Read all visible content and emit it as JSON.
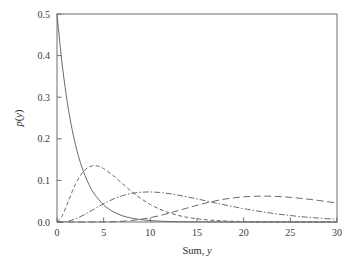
{
  "figure": {
    "background": "#ffffff",
    "frame_color": "#6f6f6f",
    "curve_color": "#6a6a6a"
  },
  "axes": {
    "x_label_prefix": "Sum,",
    "x_label_var": "y",
    "y_label_prefix": "p(",
    "y_label_var": "y",
    "y_label_suffix": ")",
    "x_ticks": [
      "0",
      "5",
      "10",
      "15",
      "20",
      "25",
      "30"
    ],
    "y_ticks": [
      "0.0",
      "0.1",
      "0.2",
      "0.3",
      "0.4",
      "0.5"
    ]
  },
  "chart_data": {
    "type": "line",
    "title": "",
    "xlabel": "Sum, y",
    "ylabel": "p(y)",
    "xlim": [
      0,
      30
    ],
    "ylim": [
      0.0,
      0.5
    ],
    "xticks": [
      0,
      5,
      10,
      15,
      20,
      25,
      30
    ],
    "yticks": [
      0.0,
      0.1,
      0.2,
      0.3,
      0.4,
      0.5
    ],
    "grid": false,
    "legend": "none",
    "series": [
      {
        "name": "n = 1",
        "linestyle": "solid",
        "rate": 0.5,
        "shape": 1,
        "peak_x": 0,
        "peak_y": 0.5,
        "x": [
          0,
          0.5,
          1,
          1.5,
          2,
          2.5,
          3,
          3.5,
          4,
          5,
          6,
          7,
          8,
          9,
          10,
          11,
          12,
          13,
          14,
          15,
          16,
          17,
          18,
          19,
          20,
          21,
          22,
          23,
          24,
          25,
          26,
          27,
          28,
          29,
          30
        ],
        "y": [
          0.5,
          0.3894,
          0.3033,
          0.2362,
          0.1839,
          0.1433,
          0.1116,
          0.0869,
          0.0677,
          0.041,
          0.0249,
          0.0151,
          0.0092,
          0.0056,
          0.0034,
          0.002,
          0.0012,
          0.0008,
          0.0005,
          0.0003,
          0.0002,
          0.0001,
          0.0001,
          0.0,
          0.0,
          0.0,
          0.0,
          0.0,
          0.0,
          0.0,
          0.0,
          0.0,
          0.0,
          0.0,
          0.0
        ]
      },
      {
        "name": "n = 3",
        "linestyle": "dashed",
        "rate": 0.5,
        "shape": 3,
        "peak_x": 4,
        "peak_y": 0.1353,
        "x": [
          0,
          0.5,
          1,
          1.5,
          2,
          2.5,
          3,
          3.5,
          4,
          4.5,
          5,
          6,
          7,
          8,
          9,
          10,
          11,
          12,
          13,
          14,
          15,
          16,
          17,
          18,
          19,
          20,
          22,
          24,
          26,
          28,
          30
        ],
        "y": [
          0,
          0.0122,
          0.0379,
          0.0664,
          0.092,
          0.1118,
          0.1255,
          0.133,
          0.1353,
          0.1335,
          0.1283,
          0.112,
          0.0925,
          0.0733,
          0.0563,
          0.0421,
          0.0309,
          0.0223,
          0.0158,
          0.0111,
          0.0077,
          0.0053,
          0.0036,
          0.0024,
          0.0016,
          0.0011,
          0.0005,
          0.0002,
          0.0001,
          0.0,
          0.0
        ]
      },
      {
        "name": "n = 5",
        "linestyle": "dashdot",
        "rate": 0.5,
        "shape": 5,
        "peak_x": 8,
        "peak_y": 0.1042,
        "x": [
          0,
          1,
          2,
          3,
          4,
          5,
          6,
          7,
          8,
          9,
          10,
          11,
          12,
          13,
          14,
          15,
          16,
          17,
          18,
          19,
          20,
          22,
          24,
          26,
          28,
          30
        ],
        "y": [
          0,
          0.0013,
          0.0077,
          0.0186,
          0.0313,
          0.0439,
          0.0548,
          0.0632,
          0.0688,
          0.0716,
          0.0722,
          0.0709,
          0.0683,
          0.0646,
          0.0602,
          0.0555,
          0.0506,
          0.0457,
          0.0409,
          0.0364,
          0.0321,
          0.0245,
          0.0182,
          0.0132,
          0.0094,
          0.0065
        ]
      },
      {
        "name": "n = 10",
        "linestyle": "longdash",
        "rate": 0.5,
        "shape": 10,
        "peak_x": 18,
        "peak_y": 0.0658,
        "x": [
          0,
          2,
          4,
          6,
          8,
          10,
          12,
          14,
          15,
          16,
          17,
          18,
          19,
          20,
          21,
          22,
          23,
          24,
          25,
          26,
          27,
          28,
          29,
          30
        ],
        "y": [
          0,
          0.0,
          0.0001,
          0.0008,
          0.0037,
          0.0104,
          0.0211,
          0.034,
          0.0403,
          0.046,
          0.051,
          0.0552,
          0.0583,
          0.0605,
          0.0618,
          0.0622,
          0.0619,
          0.0608,
          0.0592,
          0.0571,
          0.0546,
          0.0518,
          0.0488,
          0.0457
        ]
      }
    ]
  }
}
